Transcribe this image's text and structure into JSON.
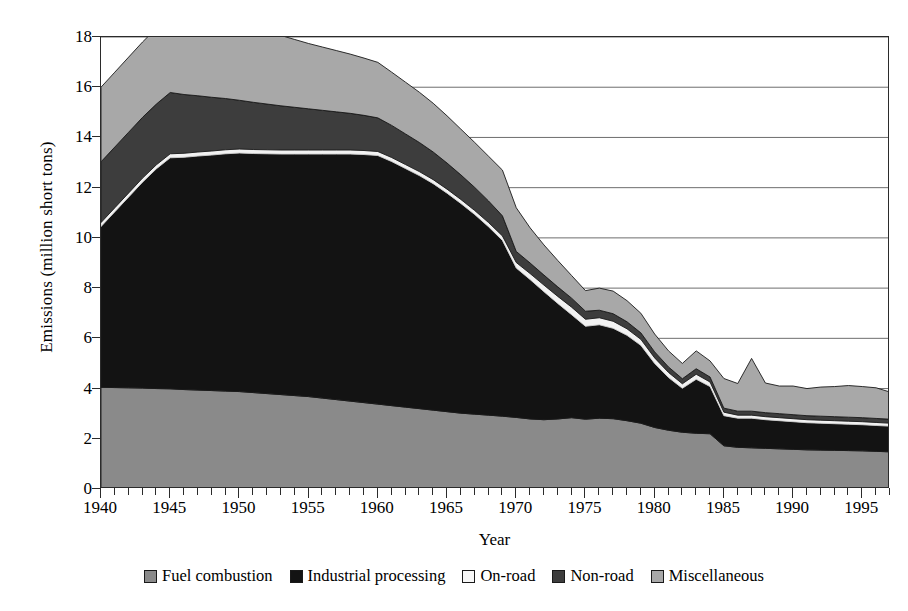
{
  "chart_data": {
    "type": "area",
    "stacked": true,
    "title": "",
    "xlabel": "Year",
    "ylabel": "Emissions (million short tons)",
    "xlim": [
      1940,
      1997
    ],
    "ylim": [
      0,
      18
    ],
    "ytick_step": 2,
    "yticks": [
      0,
      2,
      4,
      6,
      8,
      10,
      12,
      14,
      16,
      18
    ],
    "xticks_major": [
      1940,
      1945,
      1950,
      1955,
      1960,
      1965,
      1970,
      1975,
      1980,
      1985,
      1990,
      1995
    ],
    "xticks_minor_step": 1,
    "grid": "horizontal",
    "legend_position": "bottom",
    "x": [
      1940,
      1941,
      1942,
      1943,
      1944,
      1945,
      1946,
      1947,
      1948,
      1949,
      1950,
      1951,
      1952,
      1953,
      1954,
      1955,
      1956,
      1957,
      1958,
      1959,
      1960,
      1961,
      1962,
      1963,
      1964,
      1965,
      1966,
      1967,
      1968,
      1969,
      1970,
      1971,
      1972,
      1973,
      1974,
      1975,
      1976,
      1977,
      1978,
      1979,
      1980,
      1981,
      1982,
      1983,
      1984,
      1985,
      1986,
      1987,
      1988,
      1989,
      1990,
      1991,
      1992,
      1993,
      1994,
      1995,
      1996,
      1997
    ],
    "series": [
      {
        "name": "Fuel combustion",
        "color": "#8a8a8a",
        "values": [
          4.05,
          4.04,
          4.03,
          4.02,
          4.0,
          3.99,
          3.96,
          3.94,
          3.92,
          3.9,
          3.88,
          3.84,
          3.8,
          3.76,
          3.72,
          3.68,
          3.62,
          3.56,
          3.5,
          3.44,
          3.38,
          3.32,
          3.26,
          3.2,
          3.14,
          3.08,
          3.02,
          2.98,
          2.94,
          2.9,
          2.85,
          2.79,
          2.76,
          2.79,
          2.84,
          2.78,
          2.82,
          2.8,
          2.72,
          2.62,
          2.45,
          2.34,
          2.26,
          2.22,
          2.2,
          1.72,
          1.66,
          1.64,
          1.62,
          1.6,
          1.58,
          1.56,
          1.55,
          1.54,
          1.53,
          1.52,
          1.5,
          1.48
        ]
      },
      {
        "name": "Industrial processing",
        "color": "#131313",
        "values": [
          6.4,
          7.0,
          7.6,
          8.2,
          8.75,
          9.2,
          9.25,
          9.32,
          9.38,
          9.45,
          9.5,
          9.52,
          9.55,
          9.58,
          9.62,
          9.66,
          9.72,
          9.78,
          9.84,
          9.88,
          9.9,
          9.72,
          9.5,
          9.28,
          9.02,
          8.7,
          8.35,
          7.95,
          7.5,
          7.0,
          5.95,
          5.55,
          5.1,
          4.6,
          4.1,
          3.7,
          3.72,
          3.6,
          3.4,
          3.1,
          2.55,
          2.1,
          1.75,
          2.15,
          1.88,
          1.2,
          1.16,
          1.18,
          1.14,
          1.12,
          1.1,
          1.08,
          1.07,
          1.06,
          1.05,
          1.04,
          1.03,
          1.02
        ]
      },
      {
        "name": "On-road",
        "color": "#f2f2f2",
        "values": [
          0.16,
          0.16,
          0.16,
          0.16,
          0.16,
          0.16,
          0.16,
          0.16,
          0.16,
          0.16,
          0.16,
          0.16,
          0.16,
          0.16,
          0.16,
          0.16,
          0.16,
          0.16,
          0.16,
          0.16,
          0.16,
          0.16,
          0.16,
          0.16,
          0.16,
          0.16,
          0.16,
          0.16,
          0.17,
          0.18,
          0.22,
          0.24,
          0.26,
          0.28,
          0.3,
          0.28,
          0.28,
          0.28,
          0.26,
          0.24,
          0.22,
          0.2,
          0.18,
          0.2,
          0.18,
          0.14,
          0.12,
          0.12,
          0.12,
          0.12,
          0.12,
          0.12,
          0.12,
          0.12,
          0.12,
          0.12,
          0.12,
          0.12
        ]
      },
      {
        "name": "Non-road",
        "color": "#3d3d3d",
        "values": [
          2.42,
          2.42,
          2.42,
          2.42,
          2.42,
          2.44,
          2.34,
          2.24,
          2.14,
          2.04,
          1.94,
          1.88,
          1.82,
          1.76,
          1.7,
          1.64,
          1.58,
          1.52,
          1.46,
          1.4,
          1.34,
          1.28,
          1.22,
          1.16,
          1.1,
          1.04,
          0.98,
          0.92,
          0.86,
          0.8,
          0.44,
          0.42,
          0.4,
          0.38,
          0.36,
          0.32,
          0.3,
          0.3,
          0.28,
          0.26,
          0.24,
          0.22,
          0.2,
          0.22,
          0.2,
          0.16,
          0.16,
          0.16,
          0.16,
          0.16,
          0.16,
          0.16,
          0.16,
          0.16,
          0.16,
          0.16,
          0.16,
          0.16
        ]
      },
      {
        "name": "Miscellaneous",
        "color": "#a8a8a8",
        "values": [
          2.97,
          2.98,
          2.99,
          3.0,
          3.02,
          3.51,
          3.43,
          3.34,
          3.26,
          3.18,
          3.1,
          3.0,
          2.9,
          2.8,
          2.7,
          2.6,
          2.52,
          2.44,
          2.36,
          2.28,
          2.21,
          2.12,
          2.06,
          2.0,
          1.94,
          1.88,
          1.82,
          1.79,
          1.78,
          1.82,
          1.74,
          1.4,
          1.2,
          1.05,
          0.9,
          0.82,
          0.88,
          0.9,
          0.84,
          0.78,
          0.71,
          0.64,
          0.61,
          0.71,
          0.64,
          1.18,
          1.1,
          2.1,
          1.18,
          1.1,
          1.14,
          1.08,
          1.16,
          1.2,
          1.26,
          1.24,
          1.22,
          1.08
        ]
      }
    ],
    "totals_note": ""
  },
  "axes": {
    "y_title": "Emissions (million short tons)",
    "x_title": "Year",
    "y_tick_labels": [
      "0",
      "2",
      "4",
      "6",
      "8",
      "10",
      "12",
      "14",
      "16",
      "18"
    ],
    "x_tick_labels": [
      "1940",
      "1945",
      "1950",
      "1955",
      "1960",
      "1965",
      "1970",
      "1975",
      "1980",
      "1985",
      "1990",
      "1995"
    ]
  },
  "legend": {
    "items": [
      {
        "label": "Fuel combustion",
        "color": "#8a8a8a"
      },
      {
        "label": "Industrial processing",
        "color": "#131313"
      },
      {
        "label": "On-road",
        "color": "#f7f7f7"
      },
      {
        "label": "Non-road",
        "color": "#3d3d3d"
      },
      {
        "label": "Miscellaneous",
        "color": "#a8a8a8"
      }
    ]
  },
  "style": {
    "frame_color": "#2b2b2b",
    "grid_color": "#6e6e6e",
    "background": "#ffffff"
  }
}
